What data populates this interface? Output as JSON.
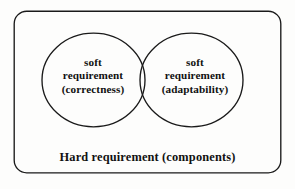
{
  "diagram": {
    "type": "venn",
    "title_visible": false,
    "background_color": "#fdfdfc",
    "stroke_color": "#1a1a1a",
    "text_color": "#111111",
    "outer_container": {
      "shape": "rounded-rectangle",
      "label": "Hard requirement (components)",
      "label_lines": [
        "Hard requirement (components)"
      ]
    },
    "sets": [
      {
        "id": "left",
        "shape": "ellipse",
        "label_lines": [
          "soft",
          "requirement",
          "(correctness)"
        ],
        "line1": "soft",
        "line2": "requirement",
        "line3": "(correctness)"
      },
      {
        "id": "right",
        "shape": "ellipse",
        "label_lines": [
          "soft",
          "requirement",
          "(adaptability)"
        ],
        "line1": "soft",
        "line2": "requirement",
        "line3": "(adaptability)"
      }
    ],
    "intersection": {
      "label": "",
      "has_label": false
    }
  }
}
